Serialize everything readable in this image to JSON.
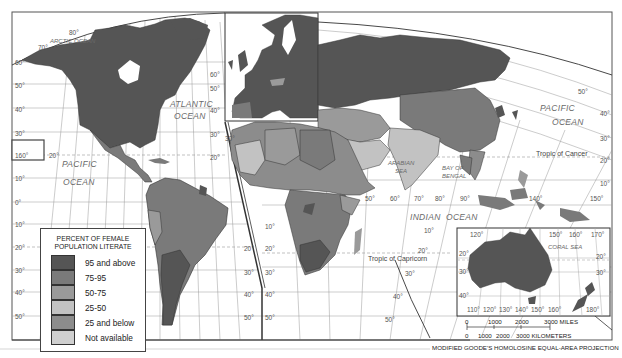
{
  "map": {
    "projection_label": "MODIFIED GOODE'S HOMOLOSINE EQUAL-AREA PROJECTION",
    "oceans": {
      "arctic": "ARCTIC OCEAN",
      "atlantic_1": "ATLANTIC",
      "atlantic_2": "OCEAN",
      "pacific_west_1": "PACIFIC",
      "pacific_west_2": "OCEAN",
      "pacific_east_1": "PACIFIC",
      "pacific_east_2": "OCEAN",
      "indian_1": "INDIAN",
      "indian_2": "OCEAN",
      "arabian_1": "ARABIAN",
      "arabian_2": "SEA",
      "bengal_1": "BAY OF",
      "bengal_2": "BENGAL",
      "coral": "CORAL SEA"
    },
    "tropics": {
      "cancer": "Tropic of Cancer",
      "capricorn": "Tropic of Capricorn"
    },
    "latitudes_west": [
      "70°",
      "60°",
      "50°",
      "40°",
      "30°",
      "20°",
      "10°",
      "0°",
      "10°",
      "20°",
      "30°",
      "40°",
      "50°"
    ],
    "latitudes_atlantic": [
      "60°",
      "50°",
      "40°",
      "30°",
      "20°"
    ],
    "latitudes_africa_right": [
      "20°",
      "30°",
      "40°",
      "50°"
    ],
    "latitudes_africa_left": [
      "10°",
      "20°",
      "30°",
      "40°",
      "50°"
    ],
    "latitudes_atlantic_south": [
      "20°",
      "30°",
      "40°",
      "50°"
    ],
    "latitudes_east": [
      "50°",
      "40°",
      "30°",
      "20°",
      "10°"
    ],
    "longitudes_indian": [
      "50°",
      "60°",
      "70°",
      "80°",
      "90°"
    ],
    "longitudes_asia": [
      "140°",
      "150°"
    ],
    "north_pole_label": "80°",
    "inset_hawaii_label": "160°",
    "inset_hawaii_lat": "20°",
    "indian_lat": "10°",
    "indian_lat_20": "20°",
    "indian_lat_30": "30°",
    "australia": {
      "top_longitudes": [
        "120°",
        "150°",
        "160°",
        "170°"
      ],
      "bottom_longitudes": [
        "110°",
        "120°",
        "130°",
        "140°",
        "150°",
        "160°",
        "180°"
      ],
      "left_lat": [
        "20°",
        "30°",
        "40°"
      ],
      "right_lat": [
        "20°",
        "30°"
      ]
    },
    "scale": {
      "miles_ticks": [
        "0",
        "1000",
        "2000",
        "3000 MILES"
      ],
      "km_ticks": [
        "0",
        "1000",
        "2000",
        "3000 KILOMETERS"
      ]
    }
  },
  "legend": {
    "title_line1": "PERCENT OF FEMALE",
    "title_line2": "POPULATION LITERATE",
    "items": [
      {
        "label": "95 and above",
        "color": "#555555"
      },
      {
        "label": "75-95",
        "color": "#7a7a7a"
      },
      {
        "label": "50-75",
        "color": "#9a9a9a"
      },
      {
        "label": "25-50",
        "color": "#c2c2c2"
      },
      {
        "label": "25 and below",
        "color": "#8c8c8c"
      },
      {
        "label": "Not available",
        "color": "#cfcfcf"
      }
    ]
  }
}
